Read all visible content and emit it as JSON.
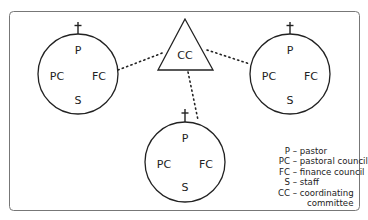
{
  "diagram": {
    "type": "organizational-structure",
    "parishes": [
      {
        "id": "left",
        "labels": {
          "top": "P",
          "left": "PC",
          "right": "FC",
          "bottom": "S"
        },
        "has_cross": true
      },
      {
        "id": "right",
        "labels": {
          "top": "P",
          "left": "PC",
          "right": "FC",
          "bottom": "S"
        },
        "has_cross": true
      },
      {
        "id": "bottom",
        "labels": {
          "top": "P",
          "left": "PC",
          "right": "FC",
          "bottom": "S"
        },
        "has_cross": true
      }
    ],
    "hub": {
      "shape": "triangle",
      "label": "CC"
    },
    "connections": [
      {
        "from": "hub",
        "to": "left",
        "style": "dotted"
      },
      {
        "from": "hub",
        "to": "right",
        "style": "dotted"
      },
      {
        "from": "hub",
        "to": "bottom",
        "style": "dotted"
      }
    ]
  },
  "legend": [
    {
      "abbr": "P",
      "sep": "–",
      "text": "pastor"
    },
    {
      "abbr": "PC",
      "sep": "–",
      "text": "pastoral council"
    },
    {
      "abbr": "FC",
      "sep": "–",
      "text": "finance council"
    },
    {
      "abbr": "S",
      "sep": "–",
      "text": "staff"
    },
    {
      "abbr": "CC",
      "sep": "–",
      "text": "coordinating",
      "continuation": "committee"
    }
  ],
  "colors": {
    "stroke": "#222222",
    "frame": "#777777",
    "background": "#ffffff"
  }
}
